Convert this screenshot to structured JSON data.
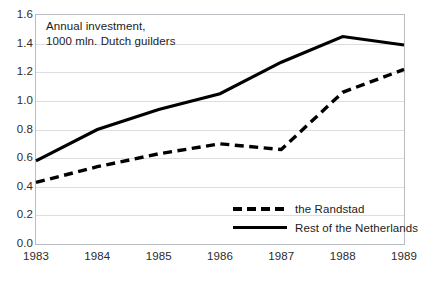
{
  "chart_data": {
    "type": "line",
    "title": "Annual investment, 1000 mln. Dutch guilders",
    "title_line1": "Annual investment,",
    "title_line2": "1000 mln. Dutch guilders",
    "xlabel": "",
    "ylabel": "",
    "categories": [
      "1983",
      "1984",
      "1985",
      "1986",
      "1987",
      "1988",
      "1989"
    ],
    "x": [
      1983,
      1984,
      1985,
      1986,
      1987,
      1988,
      1989
    ],
    "ylim": [
      0.0,
      1.6
    ],
    "ytick_labels": [
      "0.0",
      "0.2",
      "0.4",
      "0.6",
      "0.8",
      "1.0",
      "1.2",
      "1.4",
      "1.6"
    ],
    "ytick_values": [
      0.0,
      0.2,
      0.4,
      0.6,
      0.8,
      1.0,
      1.2,
      1.4,
      1.6
    ],
    "grid": true,
    "legend_position": "inside-bottom-right",
    "series": [
      {
        "name": "the Randstad",
        "style": "dashed",
        "color": "#000000",
        "values": [
          0.43,
          0.54,
          0.63,
          0.7,
          0.66,
          1.06,
          1.22
        ]
      },
      {
        "name": "Rest of the Netherlands",
        "style": "solid",
        "color": "#000000",
        "values": [
          0.58,
          0.8,
          0.94,
          1.05,
          1.27,
          1.45,
          1.39
        ]
      }
    ]
  },
  "colors": {
    "axis_text": "#2b2b2b",
    "gridline": "#dcdee1",
    "frame": "#b9bcc0",
    "series": "#000000",
    "background": "#ffffff"
  }
}
